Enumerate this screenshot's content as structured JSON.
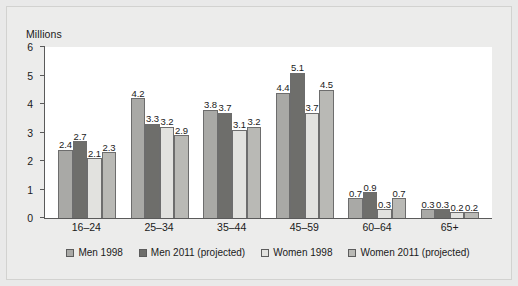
{
  "chart_data": {
    "type": "bar",
    "title": "",
    "subtitle": "",
    "xlabel": "",
    "ylabel": "Millions",
    "ylim": [
      0,
      6
    ],
    "yticks": [
      0,
      1,
      2,
      3,
      4,
      5,
      6
    ],
    "ytick_labels": [
      "0",
      "1",
      "2",
      "3",
      "4",
      "5",
      "6"
    ],
    "grid": false,
    "legend_position": "bottom",
    "categories": [
      "16–24",
      "25–34",
      "35–44",
      "45–59",
      "60–64",
      "65+"
    ],
    "series": [
      {
        "name": "Men 1998",
        "color": "#a9a9a6",
        "values": [
          2.4,
          4.2,
          3.8,
          4.4,
          0.7,
          0.3
        ]
      },
      {
        "name": "Men 2011 (projected)",
        "color": "#6e6e6b",
        "values": [
          2.7,
          3.3,
          3.7,
          5.1,
          0.9,
          0.3
        ]
      },
      {
        "name": "Women 1998",
        "color": "#e2e2df",
        "values": [
          2.1,
          3.2,
          3.1,
          3.7,
          0.3,
          0.2
        ]
      },
      {
        "name": "Women 2011 (projected)",
        "color": "#b9b9b5",
        "values": [
          2.3,
          2.9,
          3.2,
          4.5,
          0.7,
          0.2
        ]
      }
    ],
    "data_labels": [
      [
        "2.4",
        "2.7",
        "2.1",
        "2.3"
      ],
      [
        "4.2",
        "3.3",
        "3.2",
        "2.9"
      ],
      [
        "3.8",
        "3.7",
        "3.1",
        "3.2"
      ],
      [
        "4.4",
        "5.1",
        "3.7",
        "4.5"
      ],
      [
        "0.7",
        "0.9",
        "0.3",
        "0.7"
      ],
      [
        "0.3",
        "0.3",
        "0.2",
        "0.2"
      ]
    ]
  }
}
